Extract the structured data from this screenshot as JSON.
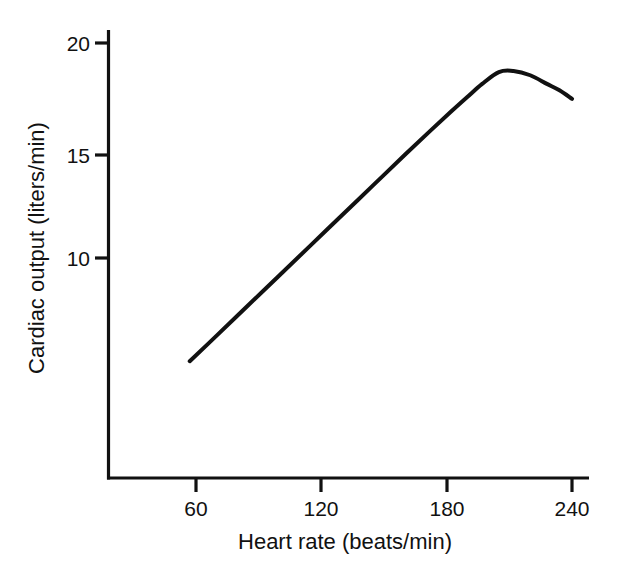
{
  "chart_data": {
    "type": "line",
    "title": "",
    "subtitle": "",
    "xlabel": "Heart rate (beats/min)",
    "ylabel": "Cardiac output (liters/min)",
    "xlim": [
      30,
      253
    ],
    "ylim": [
      0,
      21.5
    ],
    "xticks": [
      60,
      120,
      180,
      240
    ],
    "xtick_labels": [
      "60",
      "120",
      "180",
      "240"
    ],
    "yticks": [
      10,
      15,
      20
    ],
    "ytick_labels": [
      "10",
      "15",
      "20"
    ],
    "grid": false,
    "legend": null,
    "annotations": [],
    "line_color": "#111111",
    "line_width": 4,
    "axis_color": "#111111",
    "background_color": "#ffffff",
    "series": [
      {
        "name": "Cardiac output vs heart rate",
        "x": [
          57,
          70,
          85,
          100,
          115,
          130,
          145,
          160,
          172,
          182,
          190,
          197,
          205,
          212,
          220,
          228,
          234,
          240
        ],
        "y": [
          5.2,
          6.4,
          7.8,
          9.2,
          10.6,
          12.0,
          13.4,
          14.8,
          15.9,
          16.8,
          17.5,
          18.1,
          18.65,
          18.7,
          18.5,
          18.1,
          17.8,
          17.4
        ]
      }
    ],
    "peak": {
      "x": 207,
      "y": 18.7
    },
    "start_point": {
      "x": 57,
      "y": 5.2
    },
    "end_point": {
      "x": 240,
      "y": 17.4
    }
  },
  "axes": {
    "x_title": "Heart rate (beats/min)",
    "y_title": "Cardiac output (liters/min)",
    "x_tick_labels": [
      "60",
      "120",
      "180",
      "240"
    ],
    "y_tick_labels": [
      "20",
      "15",
      "10"
    ]
  }
}
